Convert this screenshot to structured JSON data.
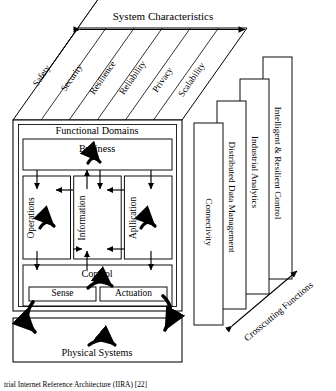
{
  "figure": {
    "domain_type": "diagram",
    "caption": "trial Internet Reference Architecture (IIRA) [22]"
  },
  "system_characteristics": {
    "arrow_label": "System Characteristics",
    "bands": [
      {
        "label": "Safety"
      },
      {
        "label": "Security"
      },
      {
        "label": "Resilience"
      },
      {
        "label": "Reliability"
      },
      {
        "label": "Privacy"
      },
      {
        "label": "Scalability"
      }
    ]
  },
  "functional_domains": {
    "title": "Functional Domains",
    "business": {
      "label": "Business"
    },
    "columns": [
      {
        "label": "Operations"
      },
      {
        "label": "Information"
      },
      {
        "label": "Apllication"
      }
    ],
    "control": {
      "label": "Control"
    },
    "control_children": [
      {
        "label": "Sense"
      },
      {
        "label": "Actuation"
      }
    ]
  },
  "physical_systems": {
    "label": "Physical Systems"
  },
  "crosscutting": {
    "arrow_label": "Crosscutting Functions",
    "boxes": [
      {
        "label": "Connectivity"
      },
      {
        "label": "Distributed Data Management"
      },
      {
        "label": "Industrial Analytics"
      },
      {
        "label": "Intelligent & Resilient Control"
      }
    ]
  },
  "style": {
    "ink": "#000000",
    "paper": "#ffffff"
  }
}
